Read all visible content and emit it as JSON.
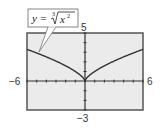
{
  "chart_data": {
    "type": "line",
    "title": "",
    "function_label": "y = ∛(x²)",
    "xlabel": "",
    "ylabel": "",
    "xlim": [
      -6,
      6
    ],
    "ylim": [
      -3,
      5
    ],
    "x_tick_step": 1,
    "y_tick_step": 1,
    "grid": false,
    "window_labels": {
      "xmin": "−6",
      "xmax": "6",
      "ymin": "−3",
      "ymax": "5"
    },
    "series": [
      {
        "name": "y = x^(2/3)",
        "x": [
          -6,
          -5,
          -4,
          -3,
          -2,
          -1,
          -0.5,
          0,
          0.5,
          1,
          2,
          3,
          4,
          5,
          6
        ],
        "y": [
          3.3,
          2.92,
          2.52,
          2.08,
          1.59,
          1.0,
          0.63,
          0,
          0.63,
          1.0,
          1.59,
          2.08,
          2.52,
          2.92,
          3.3
        ]
      }
    ]
  },
  "labels": {
    "xmin": "−6",
    "xmax": "6",
    "ymin": "−3",
    "ymax": "5"
  },
  "callout": {
    "lhs": "y = ",
    "index": "3",
    "radicand": "x",
    "exponent": "2"
  },
  "colors": {
    "frame": "#555555",
    "plot_bg": "#ebebeb",
    "curve": "#333333",
    "axis": "#333333"
  }
}
